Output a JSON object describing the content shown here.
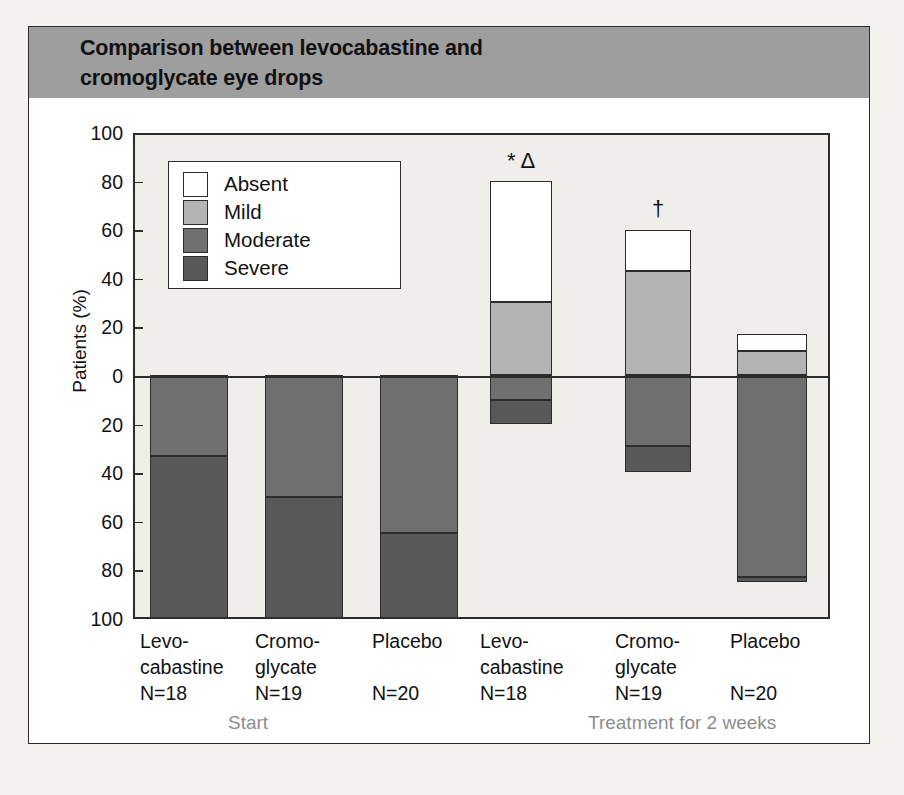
{
  "title": {
    "line1": "Comparison between levocabastine and",
    "line2": "cromoglycate eye drops"
  },
  "colors": {
    "banner": "#9e9e9e",
    "plot_background": "#efeeea",
    "axis": "#2c2c2c",
    "severe": "#585858",
    "moderate": "#6f6f6f",
    "mild": "#b4b4b4",
    "absent": "#ffffff",
    "group_label": "#8d8d8d"
  },
  "legend": {
    "items": [
      {
        "label": "Absent",
        "color": "#ffffff"
      },
      {
        "label": "Mild",
        "color": "#b4b4b4"
      },
      {
        "label": "Moderate",
        "color": "#6f6f6f"
      },
      {
        "label": "Severe",
        "color": "#585858"
      }
    ]
  },
  "axis": {
    "ylabel": "Patients (%)",
    "yticks": [
      "100",
      "80",
      "60",
      "40",
      "20",
      "0",
      "20",
      "40",
      "60",
      "80",
      "100"
    ]
  },
  "groups": [
    {
      "label": "Start"
    },
    {
      "label": "Treatment for 2 weeks"
    }
  ],
  "xlabels": [
    {
      "l1": "Levo-",
      "l2": "cabastine",
      "l3": "N=18"
    },
    {
      "l1": "Cromo-",
      "l2": "glycate",
      "l3": "N=19"
    },
    {
      "l1": "Placebo",
      "l2": "",
      "l3": "N=20"
    },
    {
      "l1": "Levo-",
      "l2": "cabastine",
      "l3": "N=18"
    },
    {
      "l1": "Cromo-",
      "l2": "glycate",
      "l3": "N=19"
    },
    {
      "l1": "Placebo",
      "l2": "",
      "l3": "N=20"
    }
  ],
  "annotations": [
    {
      "text": "* Δ",
      "bar": "levocabastine-treatment"
    },
    {
      "text": "†",
      "bar": "cromoglycate-treatment"
    }
  ],
  "chart_data": {
    "type": "bar",
    "subtype": "diverging-stacked",
    "title": "Comparison between levocabastine and cromoglycate eye drops",
    "xlabel": "",
    "ylabel": "Patients (%)",
    "ylim": [
      -100,
      100
    ],
    "yticks": [
      100,
      80,
      60,
      40,
      20,
      0,
      -20,
      -40,
      -60,
      -80,
      -100
    ],
    "ytick_labels": [
      "100",
      "80",
      "60",
      "40",
      "20",
      "0",
      "20",
      "40",
      "60",
      "80",
      "100"
    ],
    "grid": false,
    "legend_position": "inside-top-left",
    "note": "Positive axis = Absent + Mild (improved); negative axis = Moderate + Severe.",
    "categories": [
      "Start / Levocabastine (N=18)",
      "Start / Cromoglycate (N=19)",
      "Start / Placebo (N=20)",
      "Treatment 2 weeks / Levocabastine (N=18)",
      "Treatment 2 weeks / Cromoglycate (N=19)",
      "Treatment 2 weeks / Placebo (N=20)"
    ],
    "series": [
      {
        "name": "Absent",
        "color": "#ffffff",
        "values": [
          0,
          0,
          0,
          50,
          17,
          7
        ]
      },
      {
        "name": "Mild",
        "color": "#b4b4b4",
        "values": [
          0,
          0,
          0,
          30,
          43,
          10
        ]
      },
      {
        "name": "Moderate",
        "color": "#6f6f6f",
        "values": [
          -33,
          -50,
          -65,
          -10,
          -29,
          -83
        ]
      },
      {
        "name": "Severe",
        "color": "#585858",
        "values": [
          -67,
          -50,
          -35,
          -10,
          -11,
          -2
        ]
      }
    ],
    "bars": [
      {
        "group": "Start",
        "treatment": "Levocabastine",
        "n": 18,
        "segments": [
          {
            "name": "Moderate",
            "from": 0,
            "to": -33
          },
          {
            "name": "Severe",
            "from": -33,
            "to": -100
          }
        ],
        "annotation": ""
      },
      {
        "group": "Start",
        "treatment": "Cromoglycate",
        "n": 19,
        "segments": [
          {
            "name": "Moderate",
            "from": 0,
            "to": -50
          },
          {
            "name": "Severe",
            "from": -50,
            "to": -100
          }
        ],
        "annotation": ""
      },
      {
        "group": "Start",
        "treatment": "Placebo",
        "n": 20,
        "segments": [
          {
            "name": "Moderate",
            "from": 0,
            "to": -65
          },
          {
            "name": "Severe",
            "from": -65,
            "to": -100
          }
        ],
        "annotation": ""
      },
      {
        "group": "Treatment for 2 weeks",
        "treatment": "Levocabastine",
        "n": 18,
        "segments": [
          {
            "name": "Absent",
            "from": 80,
            "to": 30
          },
          {
            "name": "Mild",
            "from": 30,
            "to": 0
          },
          {
            "name": "Moderate",
            "from": 0,
            "to": -10
          },
          {
            "name": "Severe",
            "from": -10,
            "to": -20
          }
        ],
        "annotation": "* Δ"
      },
      {
        "group": "Treatment for 2 weeks",
        "treatment": "Cromoglycate",
        "n": 19,
        "segments": [
          {
            "name": "Absent",
            "from": 60,
            "to": 43
          },
          {
            "name": "Mild",
            "from": 43,
            "to": 0
          },
          {
            "name": "Moderate",
            "from": 0,
            "to": -29
          },
          {
            "name": "Severe",
            "from": -29,
            "to": -40
          }
        ],
        "annotation": "†"
      },
      {
        "group": "Treatment for 2 weeks",
        "treatment": "Placebo",
        "n": 20,
        "segments": [
          {
            "name": "Absent",
            "from": 17,
            "to": 10
          },
          {
            "name": "Mild",
            "from": 10,
            "to": 0
          },
          {
            "name": "Moderate",
            "from": 0,
            "to": -83
          },
          {
            "name": "Severe",
            "from": -83,
            "to": -85
          }
        ],
        "annotation": ""
      }
    ]
  }
}
